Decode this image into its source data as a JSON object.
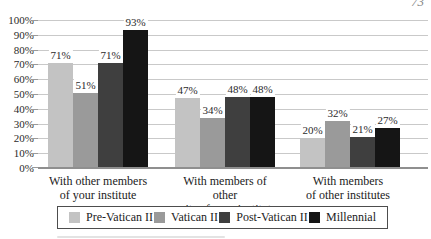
{
  "page": {
    "number_top_right": "73"
  },
  "chart_data": {
    "type": "bar",
    "title": "",
    "categories": [
      {
        "line1": "With other members",
        "line2": "of your institute"
      },
      {
        "line1": "With members of other",
        "line2": "units of your institute"
      },
      {
        "line1": "With members",
        "line2": "of other institutes"
      }
    ],
    "series": [
      {
        "name": "Pre-Vatican II",
        "color": "#c3c3c3",
        "values": [
          71,
          47,
          20
        ]
      },
      {
        "name": "Vatican II",
        "color": "#9a9a9a",
        "values": [
          51,
          34,
          32
        ]
      },
      {
        "name": "Post-Vatican II",
        "color": "#3f3f3f",
        "values": [
          71,
          48,
          21
        ]
      },
      {
        "name": "Millennial",
        "color": "#151515",
        "values": [
          93,
          48,
          27
        ]
      }
    ],
    "value_label_suffix": "%",
    "y_ticks": [
      "0%",
      "10%",
      "20%",
      "30%",
      "40%",
      "50%",
      "60%",
      "70%",
      "80%",
      "90%",
      "100%"
    ],
    "ylim": [
      0,
      100
    ],
    "grid": true,
    "legend_position": "bottom",
    "colors": {
      "gridline": "#c9c9c9",
      "baseline": "#8f8f8f",
      "text": "#2b2b2b",
      "background": "#ffffff",
      "legend_border": "#4d4d4d"
    }
  }
}
